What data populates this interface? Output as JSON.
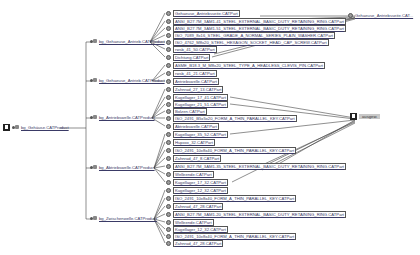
{
  "root": {
    "label": "bg_Gehäuse.CATProduct",
    "icon": "product-root-icon"
  },
  "subassemblies": [
    {
      "label": "bg_Gehaeuse_Antrieb.CATProduct",
      "y": 42
    },
    {
      "label": "bg_Gehaeuse_Antrieb.CATProduct",
      "y": 81
    },
    {
      "label": "bg_Antriebswelle.CATProduct",
      "y": 118
    },
    {
      "label": "bg_Abtriebswelle.CATProduct",
      "y": 168
    },
    {
      "label": "bg_Zwischenwelle.CATProduct",
      "y": 219
    }
  ],
  "leaves": [
    {
      "label": "Gehaeuse_Antriebsseite.CATPart",
      "y": 13,
      "group": 0
    },
    {
      "label": "ANSI_B27.7M_3AM1-41_STEEL_EXTERNAL_BASIC_DUTY_RETAINING_RING.CATPart",
      "y": 21,
      "group": 0
    },
    {
      "label": "ANSI_B27.7M_3AM1-51_STEEL_EXTERNAL_BASIC_DUTY_RETAINING_RING.CATPart",
      "y": 28,
      "group": 0
    },
    {
      "label": "ISO_7089_8x16_STEEL_GRADE_A_NORMAL_SERIES_PLAIN_WASHER.CATPart",
      "y": 35,
      "group": 0
    },
    {
      "label": "ISO_4762_M8x20_STEEL_HEXAGON_SOCKET_HEAD_CAP_SCREW.CATPart",
      "y": 42,
      "group": 0
    },
    {
      "label": "rwsb_41_50.CATPart",
      "y": 49,
      "group": 0
    },
    {
      "label": "Dichtung.CATPart",
      "y": 57,
      "group": 0
    },
    {
      "label": "ASME_B18.3_M_M8x20_STEEL_TYPE_A_HEADLESS_CLEVIS_PIN.CATPart",
      "y": 65,
      "group": 1
    },
    {
      "label": "rwsb_41_21.CATPart",
      "y": 73,
      "group": 1
    },
    {
      "label": "Antriebswelle.CATPart",
      "y": 81,
      "group": 1
    },
    {
      "label": "Zahnrad_27_13.CATPart",
      "y": 89,
      "group": 2
    },
    {
      "label": "Kugellager_17_41.CATPart",
      "y": 97,
      "group": 2
    },
    {
      "label": "Kugellager_21_51.CATPart",
      "y": 104,
      "group": 2
    },
    {
      "label": "Bolzen.CATPart",
      "y": 111,
      "group": 2
    },
    {
      "label": "ISO_2491_B5x5x20_FORM_A_THIN_PARALLEL_KEY.CATPart",
      "y": 118,
      "group": 2
    },
    {
      "label": "Abtriebswelle.CATPart",
      "y": 126,
      "group": 2
    },
    {
      "label": "Kugellager_35_52.CATPart",
      "y": 134,
      "group": 3
    },
    {
      "label": "Hupxxx_32.CATPart",
      "y": 142,
      "group": 3
    },
    {
      "label": "ISO_2491_10x8x40_FORM_A_THIN_PARALLEL_KEY.CATPart",
      "y": 150,
      "group": 3
    },
    {
      "label": "Zahnrad_47_8.CATPart",
      "y": 158,
      "group": 3
    },
    {
      "label": "ANSI_B27.7M_3AM1-35_STEEL_EXTERNAL_BASIC_DUTY_RETAINING_RING.CATPart",
      "y": 166,
      "group": 3
    },
    {
      "label": "Welleende.CATPart",
      "y": 174,
      "group": 3
    },
    {
      "label": "Kugellager_17_32.CATPart",
      "y": 182,
      "group": 3
    },
    {
      "label": "Kugellager_12_32.CATPart",
      "y": 190,
      "group": 4
    },
    {
      "label": "ISO_2491_10x8x40_FORM_A_THIN_PARALLEL_KEY.CATPart",
      "y": 198,
      "group": 4
    },
    {
      "label": "Zahnrad_47_28.CATPart",
      "y": 206,
      "group": 4
    },
    {
      "label": "ANSI_B27.7M_3AM1-20_STEEL_EXTERNAL_BASIC_DUTY_RETAINING_RING.CATPart",
      "y": 214,
      "group": 4
    },
    {
      "label": "Welleende.CATPart",
      "y": 222,
      "group": 4
    },
    {
      "label": "Kugellager_12_32.CATPart",
      "y": 229,
      "group": 4
    },
    {
      "label": "ISO_2491_10x8x40_FORM_A_THIN_PARALLEL_KEY.CATPart",
      "y": 236,
      "group": 4
    },
    {
      "label": "Zahnrad_47_28.CATPart",
      "y": 243,
      "group": 4
    }
  ],
  "targets": [
    {
      "label": "Gehaeuse_Antriebsseite.CAT...",
      "x": 357,
      "y": 16,
      "style": "part"
    },
    {
      "label": "ausgew.",
      "x": 357,
      "y": 116,
      "style": "selected"
    }
  ]
}
